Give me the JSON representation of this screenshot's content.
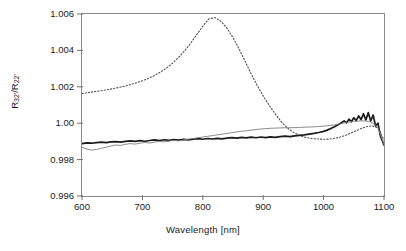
{
  "chart_data": {
    "type": "line",
    "title": "",
    "xlabel": "Wavelength [nm]",
    "ylabel": "R32'/R22'",
    "ylabel_base": "R",
    "ylabel_sub1": "32'",
    "ylabel_mid": "/R",
    "ylabel_sub2": "22'",
    "xlim": [
      600,
      1100
    ],
    "ylim": [
      0.996,
      1.006
    ],
    "xticks": [
      600,
      700,
      800,
      900,
      1000,
      1100
    ],
    "xtick_labels": [
      "600",
      "700",
      "800",
      "900",
      "1000",
      "1100"
    ],
    "yticks": [
      0.996,
      0.998,
      1.0,
      1.002,
      1.004,
      1.006
    ],
    "ytick_labels": [
      "0.996",
      "0.998",
      "1.00",
      "1.002",
      "1.004",
      "1.006"
    ],
    "grid": false,
    "legend": "none",
    "frame": "box",
    "series": [
      {
        "name": "dotted-curve",
        "style": "dotted",
        "color": "#4d4d4d",
        "width": 1.1,
        "x": [
          600,
          610,
          620,
          630,
          640,
          650,
          660,
          670,
          680,
          690,
          700,
          710,
          720,
          730,
          740,
          750,
          760,
          770,
          780,
          790,
          800,
          810,
          820,
          830,
          840,
          850,
          860,
          870,
          880,
          890,
          900,
          910,
          920,
          930,
          940,
          950,
          960,
          970,
          980,
          990,
          1000,
          1010,
          1020,
          1030,
          1040,
          1050,
          1060,
          1070,
          1080,
          1090,
          1100
        ],
        "y": [
          1.00163,
          1.00168,
          1.00173,
          1.00178,
          1.00183,
          1.00189,
          1.00196,
          1.00203,
          1.00212,
          1.00222,
          1.00233,
          1.00246,
          1.00262,
          1.00281,
          1.00303,
          1.0033,
          1.00362,
          1.00398,
          1.0044,
          1.00487,
          1.00533,
          1.00573,
          1.0058,
          1.0056,
          1.00522,
          1.0047,
          1.00408,
          1.0034,
          1.00272,
          1.00208,
          1.0015,
          1.00098,
          1.0005,
          1.00008,
          0.99974,
          0.9995,
          0.99933,
          0.99922,
          0.99916,
          0.99913,
          0.99912,
          0.99913,
          0.99918,
          0.99926,
          0.99938,
          0.99953,
          0.99968,
          0.9998,
          0.99986,
          0.99975,
          0.99908
        ]
      },
      {
        "name": "thick-solid-curve",
        "style": "solid",
        "color": "#1a1a1a",
        "width": 1.7,
        "x": [
          600,
          608,
          616,
          624,
          632,
          640,
          648,
          656,
          664,
          672,
          680,
          688,
          696,
          704,
          712,
          720,
          728,
          736,
          744,
          752,
          760,
          768,
          776,
          784,
          792,
          800,
          808,
          816,
          824,
          832,
          840,
          848,
          856,
          864,
          872,
          880,
          888,
          896,
          904,
          912,
          920,
          928,
          936,
          944,
          952,
          960,
          968,
          976,
          984,
          992,
          1000,
          1006,
          1012,
          1018,
          1024,
          1030,
          1034,
          1038,
          1042,
          1046,
          1050,
          1054,
          1058,
          1062,
          1066,
          1070,
          1074,
          1078,
          1082,
          1086,
          1090,
          1094,
          1097,
          1100
        ],
        "y": [
          0.99888,
          0.99892,
          0.9989,
          0.99893,
          0.99896,
          0.99893,
          0.99897,
          0.99899,
          0.99896,
          0.999,
          0.99903,
          0.999,
          0.99904,
          0.99901,
          0.99905,
          0.99908,
          0.99905,
          0.99909,
          0.99906,
          0.9991,
          0.99907,
          0.99911,
          0.99908,
          0.99912,
          0.99915,
          0.99912,
          0.99916,
          0.99913,
          0.99917,
          0.99914,
          0.99918,
          0.99921,
          0.99918,
          0.99922,
          0.99919,
          0.99923,
          0.9992,
          0.99924,
          0.99921,
          0.99925,
          0.99922,
          0.99926,
          0.99929,
          0.99926,
          0.9993,
          0.99933,
          0.99936,
          0.9994,
          0.99944,
          0.99949,
          0.99955,
          0.99962,
          0.99971,
          0.99981,
          0.99992,
          1.00004,
          1.00013,
          1.00002,
          1.00022,
          1.00008,
          1.0003,
          1.00014,
          1.0004,
          1.0002,
          1.00052,
          1.00018,
          1.00058,
          1.00012,
          1.00045,
          0.99985,
          1.0,
          0.9993,
          0.99905,
          0.9988
        ]
      },
      {
        "name": "thin-gray-curve",
        "style": "solid",
        "color": "#7d7d7d",
        "width": 0.9,
        "x": [
          600,
          608,
          616,
          624,
          632,
          640,
          648,
          656,
          664,
          672,
          680,
          688,
          696,
          704,
          712,
          720,
          728,
          736,
          744,
          752,
          760,
          768,
          776,
          784,
          792,
          800,
          808,
          816,
          824,
          832,
          840,
          848,
          856,
          864,
          872,
          880,
          888,
          896,
          904,
          912,
          920,
          928,
          936,
          944,
          952,
          960,
          968,
          976,
          984,
          992,
          1000,
          1006,
          1012,
          1018,
          1024,
          1030,
          1034,
          1038,
          1042,
          1046,
          1050,
          1054,
          1058,
          1062,
          1066,
          1070,
          1074,
          1078,
          1082,
          1086,
          1090,
          1094,
          1097,
          1100
        ],
        "y": [
          0.99868,
          0.99858,
          0.99852,
          0.99856,
          0.99862,
          0.99868,
          0.99875,
          0.9988,
          0.99878,
          0.99884,
          0.99888,
          0.99885,
          0.9989,
          0.99894,
          0.99891,
          0.99896,
          0.999,
          0.99897,
          0.99902,
          0.99906,
          0.99903,
          0.99908,
          0.99912,
          0.99916,
          0.9992,
          0.99924,
          0.99928,
          0.99932,
          0.99936,
          0.9994,
          0.99944,
          0.99948,
          0.99952,
          0.99956,
          0.99958,
          0.99962,
          0.99965,
          0.99968,
          0.9997,
          0.99972,
          0.99973,
          0.99974,
          0.99975,
          0.99975,
          0.99976,
          0.99977,
          0.99978,
          0.99979,
          0.9998,
          0.99982,
          0.99984,
          0.99986,
          0.99988,
          0.99991,
          0.99994,
          0.99998,
          1.00001,
          1.00004,
          1.00006,
          1.00008,
          1.0001,
          1.00011,
          1.00012,
          1.00013,
          1.00013,
          1.00012,
          1.0001,
          1.00006,
          1.0,
          0.9999,
          0.99975,
          0.9994,
          0.9991,
          0.99884
        ]
      }
    ]
  }
}
